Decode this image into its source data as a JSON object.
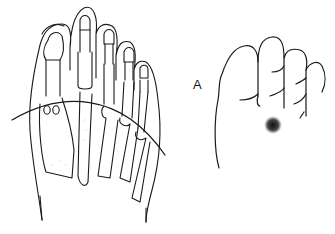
{
  "figure": {
    "left_panel": {
      "description": "Dorsal view of foot skeleton with curved line across metatarsal heads"
    },
    "right_panel": {
      "label": "A",
      "description": "Plantar forefoot outline with dark marked spot"
    },
    "colors": {
      "line": "#1a1a1a",
      "background": "#ffffff",
      "spot": "#111111"
    }
  }
}
